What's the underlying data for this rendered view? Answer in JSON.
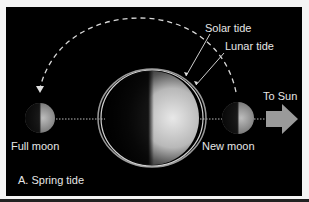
{
  "diagram": {
    "caption": "A. Spring tide",
    "labels": {
      "solar_tide": "Solar tide",
      "lunar_tide": "Lunar tide",
      "to_sun": "To Sun",
      "full_moon": "Full moon",
      "new_moon": "New moon"
    },
    "colors": {
      "background": "#000000",
      "text": "#e6e6e6",
      "arrow": "#9a9a9a",
      "dashed_path": "#d8d8d8"
    }
  }
}
